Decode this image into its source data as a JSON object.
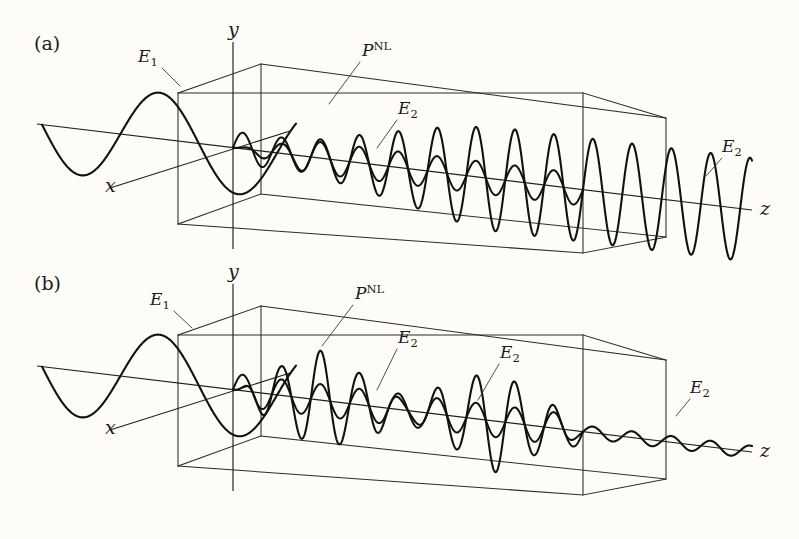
{
  "figure": {
    "background_color": "#fdfcf8",
    "ink_color": "#111110",
    "width": 799,
    "height": 539
  },
  "panels": [
    {
      "id": "a",
      "label": "(a)",
      "label_x": 34,
      "label_y": 50,
      "condition": "phase-matched",
      "description": "Second-harmonic field E2 grows monotonically along z inside the crystal",
      "axes": [
        {
          "name": "y-axis",
          "label": "y",
          "label_x": 228,
          "label_y": 36
        },
        {
          "name": "x-axis",
          "label": "x",
          "label_x": 105,
          "label_y": 192
        },
        {
          "name": "z-axis",
          "label": "z",
          "label_x": 760,
          "label_y": 215
        }
      ],
      "annotations": [
        {
          "name": "incident-field-label",
          "label": "E",
          "sub": "1",
          "sup": "",
          "x": 138,
          "y": 62,
          "leader_x1": 162,
          "leader_y1": 68,
          "leader_x2": 180,
          "leader_y2": 86
        },
        {
          "name": "nonlinear-polarization-label",
          "label": "P",
          "sub": "",
          "sup": "NL",
          "x": 362,
          "y": 56,
          "leader_x1": 360,
          "leader_y1": 62,
          "leader_x2": 329,
          "leader_y2": 104
        },
        {
          "name": "second-harmonic-label-inside",
          "label": "E",
          "sub": "2",
          "sup": "",
          "x": 398,
          "y": 114,
          "leader_x1": 397,
          "leader_y1": 120,
          "leader_x2": 377,
          "leader_y2": 148
        },
        {
          "name": "second-harmonic-label-outside",
          "label": "E",
          "sub": "2",
          "sup": "",
          "x": 722,
          "y": 152,
          "leader_x1": 722,
          "leader_y1": 158,
          "leader_x2": 706,
          "leader_y2": 176
        }
      ]
    },
    {
      "id": "b",
      "label": "(b)",
      "label_x": 34,
      "label_y": 290,
      "condition": "not phase-matched",
      "description": "Second-harmonic field E2 oscillates (grows and decays) along z inside the crystal and exits weak",
      "axes": [
        {
          "name": "y-axis",
          "label": "y",
          "label_x": 228,
          "label_y": 278
        },
        {
          "name": "x-axis",
          "label": "x",
          "label_x": 105,
          "label_y": 434
        },
        {
          "name": "z-axis",
          "label": "z",
          "label_x": 760,
          "label_y": 456
        }
      ],
      "annotations": [
        {
          "name": "incident-field-label",
          "label": "E",
          "sub": "1",
          "sup": "",
          "x": 150,
          "y": 305,
          "leader_x1": 174,
          "leader_y1": 311,
          "leader_x2": 192,
          "leader_y2": 328
        },
        {
          "name": "nonlinear-polarization-label",
          "label": "P",
          "sub": "",
          "sup": "NL",
          "x": 355,
          "y": 299,
          "leader_x1": 353,
          "leader_y1": 305,
          "leader_x2": 322,
          "leader_y2": 346
        },
        {
          "name": "second-harmonic-label-inside-1",
          "label": "E",
          "sub": "2",
          "sup": "",
          "x": 398,
          "y": 343,
          "leader_x1": 397,
          "leader_y1": 349,
          "leader_x2": 377,
          "leader_y2": 390
        },
        {
          "name": "second-harmonic-label-inside-2",
          "label": "E",
          "sub": "2",
          "sup": "",
          "x": 500,
          "y": 358,
          "leader_x1": 499,
          "leader_y1": 364,
          "leader_x2": 478,
          "leader_y2": 400
        },
        {
          "name": "second-harmonic-label-outside",
          "label": "E",
          "sub": "2",
          "sup": "",
          "x": 690,
          "y": 393,
          "leader_x1": 690,
          "leader_y1": 399,
          "leader_x2": 676,
          "leader_y2": 416
        }
      ]
    }
  ],
  "chart_data": {
    "type": "line",
    "xlabel": "z",
    "ylabel": "field amplitude",
    "grid": false,
    "legend": [
      "E1",
      "P-NL",
      "E2"
    ],
    "panel_a": {
      "label": "(a)",
      "crystal_entrance_z": 0,
      "crystal_exit_z": 1,
      "series": [
        {
          "name": "E1",
          "role": "fundamental input wave",
          "waveform": "sine",
          "cycles_before_crystal": 1.6,
          "amplitude": 1.0,
          "note": "enters crystal from the left along z"
        },
        {
          "name": "P-NL",
          "role": "nonlinear polarization",
          "waveform": "sine",
          "frequency_multiplier": 2,
          "amplitude": 0.33,
          "note": "small constant-amplitude wave at twice the fundamental frequency"
        },
        {
          "name": "E2",
          "role": "second-harmonic field",
          "waveform": "sine",
          "frequency_multiplier": 2,
          "amplitude_envelope": "linear growth from 0 to 1.0 across the crystal, then constant outside",
          "envelope_values": [
            0.0,
            0.18,
            0.36,
            0.54,
            0.72,
            0.9,
            1.0,
            1.0,
            1.0
          ],
          "note": "monotonic growth because phases stay matched"
        }
      ]
    },
    "panel_b": {
      "label": "(b)",
      "crystal_entrance_z": 0,
      "crystal_exit_z": 1,
      "series": [
        {
          "name": "E1",
          "role": "fundamental input wave",
          "waveform": "sine",
          "cycles_before_crystal": 1.6,
          "amplitude": 1.0
        },
        {
          "name": "P-NL",
          "role": "nonlinear polarization",
          "waveform": "sine",
          "frequency_multiplier": 2,
          "amplitude": 0.33
        },
        {
          "name": "E2",
          "role": "second-harmonic field",
          "waveform": "sine",
          "frequency_multiplier": 2,
          "amplitude_envelope": "oscillating: grows then decays with coherence length period",
          "envelope_values": [
            0.0,
            0.55,
            0.95,
            0.6,
            0.18,
            0.62,
            0.98,
            0.55,
            0.12
          ],
          "note": "beats with coherence length because phases walk off"
        }
      ]
    }
  }
}
